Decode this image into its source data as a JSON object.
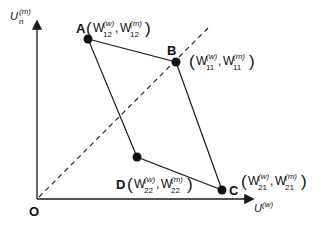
{
  "diagram": {
    "y_axis": {
      "label": "U",
      "sub": "n",
      "sup": "(m)"
    },
    "x_axis": {
      "label": "U",
      "sup": "(w)"
    },
    "origin": {
      "label": "O"
    },
    "points": [
      {
        "id": "A",
        "label": "A",
        "w_sup": "(w)",
        "w_sub": "12",
        "m_sup": "(m)",
        "m_sub": "12"
      },
      {
        "id": "B",
        "label": "B",
        "w_sup": "(w)",
        "w_sub": "11",
        "m_sup": "(m)",
        "m_sub": "11"
      },
      {
        "id": "C",
        "label": "C",
        "w_sup": "(w)",
        "w_sub": "21",
        "m_sup": "(m)",
        "m_sub": "21"
      },
      {
        "id": "D",
        "label": "D",
        "w_sup": "(w)",
        "w_sub": "22",
        "m_sup": "(m)",
        "m_sub": "22"
      }
    ],
    "symbols": {
      "W": "W",
      "comma": ",",
      "open": "(",
      "close": ")"
    },
    "colors": {
      "line": "#1a1a1a",
      "background": "#ffffff"
    }
  }
}
